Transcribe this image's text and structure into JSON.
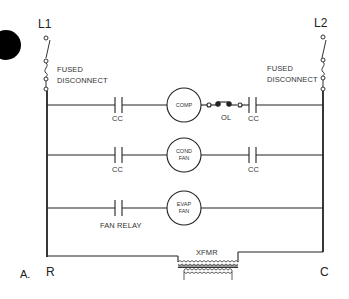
{
  "diagram": {
    "type": "ladder-wiring-schematic",
    "panel_label": "A.",
    "terminals": {
      "left_line": "L1",
      "right_line": "L2",
      "left_control": "R",
      "right_control": "C"
    },
    "disconnects": {
      "left": [
        "FUSED",
        "DISCONNECT"
      ],
      "right": [
        "FUSED",
        "DISCONNECT"
      ]
    },
    "rungs": [
      {
        "id": "compressor",
        "left_contact": "CC",
        "load": [
          "COMP"
        ],
        "series_devices": [
          "OL"
        ],
        "right_contact": "CC"
      },
      {
        "id": "condenser-fan",
        "left_contact": "CC",
        "load": [
          "COND",
          "FAN"
        ],
        "right_contact": "CC"
      },
      {
        "id": "evaporator-fan",
        "left_contact": "FAN RELAY",
        "load": [
          "EVAP",
          "FAN"
        ]
      }
    ],
    "transformer": {
      "label": "XFMR"
    },
    "colors": {
      "line": "#222222",
      "text": "#333333",
      "background": "#ffffff",
      "marker": "#000000"
    }
  }
}
